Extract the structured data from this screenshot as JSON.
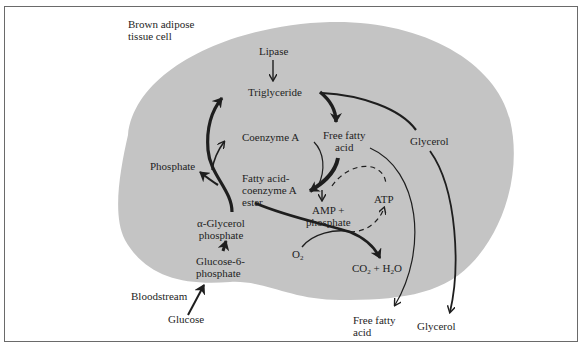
{
  "diagram": {
    "title": "Brown adipose\ntissue cell",
    "colors": {
      "cell_fill": "#c4c4c4",
      "ink": "#1e1e1e",
      "frame": "#6a6a6a",
      "background": "#ffffff"
    },
    "nodes": {
      "lipase": "Lipase",
      "triglyceride": "Triglyceride",
      "coenzyme_a": "Coenzyme A",
      "free_fatty_acid_inside": "Free fatty\nacid",
      "glycerol_inside": "Glycerol",
      "phosphate": "Phosphate",
      "fatty_acid_coa_ester": "Fatty acid-\ncoenzyme A\nester",
      "amp_phosphate": "AMP +\nphosphate",
      "atp": "ATP",
      "alpha_glycerol_phosphate": "α-Glycerol\nphosphate",
      "glucose_6_phosphate": "Glucose-6-\nphosphate",
      "o2_base": "O",
      "o2_sub": "2",
      "co2_base": "CO",
      "co2_sub": "2",
      "plus_h": " + H",
      "h2o_sub": "2",
      "h2o_tail": "O",
      "bloodstream": "Bloodstream",
      "glucose": "Glucose",
      "free_fatty_acid_outside": "Free fatty\nacid",
      "glycerol_outside": "Glycerol"
    },
    "edges": [
      {
        "from": "Lipase",
        "to": "Triglyceride",
        "style": "thin"
      },
      {
        "from": "Triglyceride",
        "to": "Free fatty acid",
        "style": "thick"
      },
      {
        "from": "Triglyceride",
        "to": "Glycerol",
        "style": "medium"
      },
      {
        "from": "Free fatty acid",
        "to": "Fatty acid-coenzyme A ester",
        "style": "thick"
      },
      {
        "from": "Coenzyme A",
        "to": "Fatty acid-coenzyme A ester",
        "style": "thin"
      },
      {
        "from": "Fatty acid-coenzyme A ester",
        "to": "AMP + phosphate",
        "style": "thin"
      },
      {
        "from": "AMP + phosphate",
        "to": "ATP",
        "style": "dashed"
      },
      {
        "from": "ATP",
        "to": "Fatty acid-coenzyme A ester",
        "style": "dashed"
      },
      {
        "from": "Fatty acid-coenzyme A ester",
        "to": "CO2 + H2O",
        "style": "medium"
      },
      {
        "from": "O2",
        "to": "CO2 + H2O",
        "style": "thin"
      },
      {
        "from": "α-Glycerol phosphate",
        "to": "Triglyceride",
        "style": "thick"
      },
      {
        "from": "α-Glycerol phosphate",
        "to": "Phosphate",
        "style": "medium"
      },
      {
        "from": "Glucose-6-phosphate",
        "to": "α-Glycerol phosphate",
        "style": "thick"
      },
      {
        "from": "Glucose",
        "to": "Glucose-6-phosphate",
        "style": "medium"
      },
      {
        "from": "Free fatty acid (inside)",
        "to": "Free fatty acid (bloodstream)",
        "style": "thin"
      },
      {
        "from": "Glycerol (inside)",
        "to": "Glycerol (bloodstream)",
        "style": "medium"
      }
    ]
  }
}
